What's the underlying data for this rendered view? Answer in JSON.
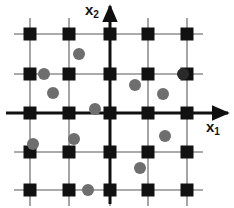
{
  "figure": {
    "width": 234,
    "height": 208,
    "background": "#ffffff"
  },
  "axes": {
    "x1": {
      "label_base": "x",
      "label_sub": "1",
      "orientation": "horizontal",
      "arrow_direction": "right",
      "y_pixel": 113,
      "x_start": 6,
      "x_end": 228,
      "color": "#101010",
      "width": 3
    },
    "x2": {
      "label_base": "x",
      "label_sub": "2",
      "orientation": "vertical",
      "arrow_direction": "up",
      "x_pixel": 110,
      "y_start": 204,
      "y_end": 6,
      "color": "#101010",
      "width": 3
    }
  },
  "grid": {
    "color": "#8f8f8f",
    "width": 1.6,
    "columns_x": [
      30,
      69,
      110,
      148,
      187
    ],
    "rows_y": [
      34,
      74,
      113,
      152,
      190
    ],
    "line_overhang": 16
  },
  "lattice_points": {
    "marker": "square",
    "color": "#111111",
    "size": 13,
    "count": 25,
    "points": [
      {
        "x": 30,
        "y": 34
      },
      {
        "x": 69,
        "y": 34
      },
      {
        "x": 110,
        "y": 34
      },
      {
        "x": 148,
        "y": 34
      },
      {
        "x": 187,
        "y": 34
      },
      {
        "x": 30,
        "y": 74
      },
      {
        "x": 69,
        "y": 74
      },
      {
        "x": 110,
        "y": 74
      },
      {
        "x": 148,
        "y": 74
      },
      {
        "x": 187,
        "y": 74
      },
      {
        "x": 30,
        "y": 113
      },
      {
        "x": 69,
        "y": 113
      },
      {
        "x": 110,
        "y": 113
      },
      {
        "x": 148,
        "y": 113
      },
      {
        "x": 187,
        "y": 113
      },
      {
        "x": 30,
        "y": 152
      },
      {
        "x": 69,
        "y": 152
      },
      {
        "x": 110,
        "y": 152
      },
      {
        "x": 148,
        "y": 152
      },
      {
        "x": 187,
        "y": 152
      },
      {
        "x": 30,
        "y": 190
      },
      {
        "x": 69,
        "y": 190
      },
      {
        "x": 110,
        "y": 190
      },
      {
        "x": 148,
        "y": 190
      },
      {
        "x": 187,
        "y": 190
      }
    ]
  },
  "sample_points": {
    "marker": "circle",
    "color": "#6e6e6e",
    "dark_color": "#2a2a2a",
    "radius": 6,
    "count": 13,
    "points": [
      {
        "x": 79,
        "y": 54,
        "shade": "light"
      },
      {
        "x": 44,
        "y": 74,
        "shade": "light"
      },
      {
        "x": 53,
        "y": 93,
        "shade": "light"
      },
      {
        "x": 183,
        "y": 74,
        "shade": "dark"
      },
      {
        "x": 135,
        "y": 85,
        "shade": "light"
      },
      {
        "x": 163,
        "y": 94,
        "shade": "light"
      },
      {
        "x": 95,
        "y": 109,
        "shade": "light"
      },
      {
        "x": 33,
        "y": 144,
        "shade": "light"
      },
      {
        "x": 74,
        "y": 139,
        "shade": "light"
      },
      {
        "x": 165,
        "y": 136,
        "shade": "light"
      },
      {
        "x": 140,
        "y": 168,
        "shade": "light"
      },
      {
        "x": 88,
        "y": 190,
        "shade": "light"
      }
    ]
  }
}
